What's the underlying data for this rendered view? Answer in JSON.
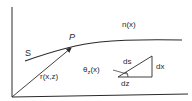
{
  "diagram": {
    "labels": {
      "curve": "S",
      "point": "P",
      "index": "n(x)",
      "vector": "r(x,z)",
      "angle_theta": "θ",
      "angle_sub": "z",
      "angle_arg": "(x)",
      "hypotenuse": "ds",
      "vertical": "dx",
      "horizontal": "dz"
    },
    "colors": {
      "line": "#2a2a2a",
      "background": "#ffffff"
    }
  }
}
